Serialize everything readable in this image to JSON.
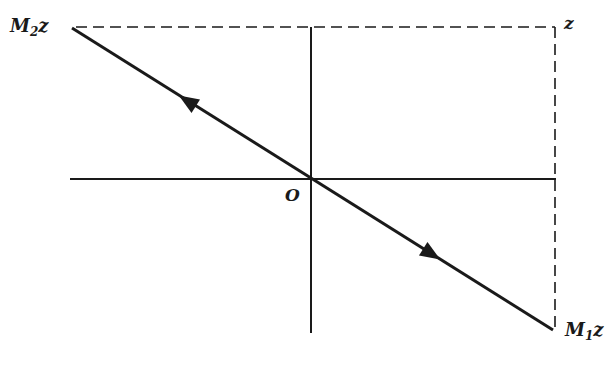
{
  "diagram": {
    "labels": {
      "top_left": {
        "main": "M",
        "sub": "2",
        "var": "z"
      },
      "top_right": {
        "main": "z"
      },
      "bottom_right": {
        "main": "M",
        "sub": "1",
        "var": "z"
      },
      "origin": {
        "main": "O"
      }
    },
    "colors": {
      "line": "#1a1a1a",
      "background": "#ffffff"
    },
    "arrows": [
      {
        "direction": "up-left",
        "position": "upper segment"
      },
      {
        "direction": "down-right",
        "position": "lower segment"
      }
    ]
  }
}
